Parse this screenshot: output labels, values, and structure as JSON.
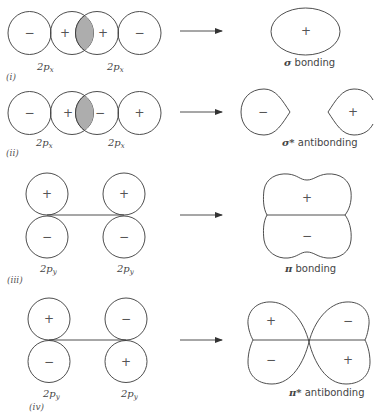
{
  "diagram": {
    "rows": [
      {
        "id": "i",
        "row_label": "(i)",
        "atomic_orbitals": [
          {
            "label": "2p",
            "subscript": "x",
            "lobes": [
              "−",
              "+"
            ]
          },
          {
            "label": "2p",
            "subscript": "x",
            "lobes": [
              "+",
              "−"
            ]
          }
        ],
        "overlap": "shaded",
        "result_signs": [
          "+"
        ],
        "result_label_greek": "σ",
        "result_label_text": " bonding"
      },
      {
        "id": "ii",
        "row_label": "(ii)",
        "atomic_orbitals": [
          {
            "label": "2p",
            "subscript": "x",
            "lobes": [
              "−",
              "+"
            ]
          },
          {
            "label": "2p",
            "subscript": "x",
            "lobes": [
              "−",
              "+"
            ]
          }
        ],
        "overlap": "shaded",
        "result_signs": [
          "−",
          "+"
        ],
        "result_label_greek": "σ*",
        "result_label_text": " antibonding"
      },
      {
        "id": "iii",
        "row_label": "(iii)",
        "atomic_orbitals": [
          {
            "label": "2p",
            "subscript": "y",
            "lobes": [
              "+",
              "−"
            ]
          },
          {
            "label": "2p",
            "subscript": "y",
            "lobes": [
              "+",
              "−"
            ]
          }
        ],
        "result_signs": [
          "+",
          "−"
        ],
        "result_label_greek": "π",
        "result_label_text": " bonding"
      },
      {
        "id": "iv",
        "row_label": "(iv)",
        "atomic_orbitals": [
          {
            "label": "2p",
            "subscript": "y",
            "lobes": [
              "+",
              "−"
            ]
          },
          {
            "label": "2p",
            "subscript": "y",
            "lobes": [
              "−",
              "+"
            ]
          }
        ],
        "result_signs": [
          "+",
          "−",
          "−",
          "+"
        ],
        "result_label_greek": "π*",
        "result_label_text": " antibonding"
      }
    ],
    "colors": {
      "stroke": "#3a3a3a",
      "overlap_fill": "#b8b8b8",
      "background": "#ffffff"
    }
  }
}
